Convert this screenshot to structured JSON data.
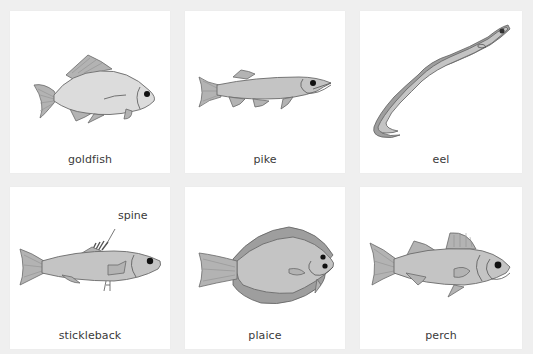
{
  "colors": {
    "background": "#efefef",
    "card": "#ffffff",
    "fish_fill": "#c4c4c4",
    "fish_outline": "#6a6a6a",
    "text": "#3a3a3a"
  },
  "cards": [
    {
      "name": "goldfish",
      "label": "goldfish"
    },
    {
      "name": "pike",
      "label": "pike"
    },
    {
      "name": "eel",
      "label": "eel"
    },
    {
      "name": "stickleback",
      "label": "stickleback",
      "annotation": "spine"
    },
    {
      "name": "plaice",
      "label": "plaice"
    },
    {
      "name": "perch",
      "label": "perch"
    }
  ]
}
